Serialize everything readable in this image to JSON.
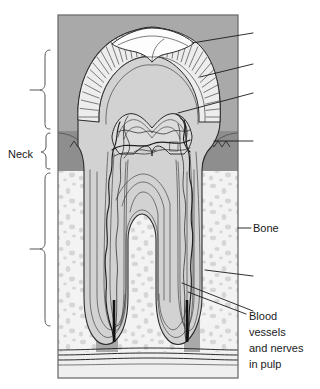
{
  "figure": {
    "panel": {
      "x": 58,
      "y": 15,
      "width": 180,
      "height": 363,
      "background_color": "#a9a9a9",
      "border_color": "#6e6e6e"
    },
    "colors": {
      "gum": "#8e8e8e",
      "gum_dark": "#6f6f6f",
      "enamel": "#e8e8e8",
      "dentine": "#d2d2d2",
      "cementum": "#c8c8c8",
      "pulp": "#dcdcdc",
      "bone_fill": "#f3f3f3",
      "bone_speckle": "#d6d6d6",
      "occlusal_white": "#fdfdfd",
      "ink": "#1a1a1a",
      "base_band": "#efefef"
    }
  },
  "labels": [
    {
      "id": "neck",
      "text": "Neck",
      "x": 8,
      "y": 154,
      "anchor": "start",
      "lines": [
        "Neck"
      ]
    },
    {
      "id": "bone",
      "text": "Bone",
      "x": 253,
      "y": 232,
      "anchor": "start",
      "lines": [
        "Bone"
      ]
    },
    {
      "id": "blood-vessels-and-nerves-in-pulp",
      "text": "Blood vessels and nerves in pulp",
      "x": 249,
      "y": 316,
      "anchor": "start",
      "lines": [
        "Blood",
        "vessels",
        "and nerves",
        "in pulp"
      ]
    }
  ],
  "braces": [
    {
      "id": "crown-brace",
      "top": 50,
      "bottom": 129,
      "tick_y": 90,
      "label": ""
    },
    {
      "id": "neck-brace",
      "top": 133,
      "bottom": 169,
      "tick_y": 152,
      "label": "Neck"
    },
    {
      "id": "root-brace",
      "top": 173,
      "bottom": 326,
      "tick_y": 249,
      "label": ""
    }
  ],
  "leaders": [
    {
      "id": "leader-enamel",
      "points": "192,43 253,33",
      "label": ""
    },
    {
      "id": "leader-dentine",
      "points": "200,77 253,64",
      "label": ""
    },
    {
      "id": "leader-pulp-chamber",
      "points": "178,113 253,93",
      "label": ""
    },
    {
      "id": "leader-gum",
      "points": "214,141 253,141",
      "label": ""
    },
    {
      "id": "leader-bone",
      "points": "238,228 251,228",
      "label": "Bone"
    },
    {
      "id": "leader-periodontal",
      "points": "205,270 253,276",
      "label": ""
    },
    {
      "id": "leader-root-canal",
      "points": "182,283 253,311",
      "label": ""
    },
    {
      "id": "leader-vessel-apex",
      "points": "188,292 246,314",
      "label": "Blood vessels and nerves in pulp"
    }
  ],
  "structures": [
    {
      "id": "enamel",
      "name": "enamel",
      "rendering": "radial-hatched-cap"
    },
    {
      "id": "dentine",
      "name": "dentine",
      "rendering": "light-gray-body"
    },
    {
      "id": "pulp-chamber",
      "name": "pulp chamber",
      "rendering": "nested-outline"
    },
    {
      "id": "root-canal",
      "name": "root canal",
      "rendering": "nested-outline"
    },
    {
      "id": "gum",
      "name": "gum",
      "rendering": "gray-with-sawtooth-margin"
    },
    {
      "id": "bone",
      "name": "bone",
      "rendering": "stippled"
    },
    {
      "id": "blood-vessels",
      "name": "blood vessels and nerves",
      "rendering": "wavy-dark-lines"
    }
  ]
}
